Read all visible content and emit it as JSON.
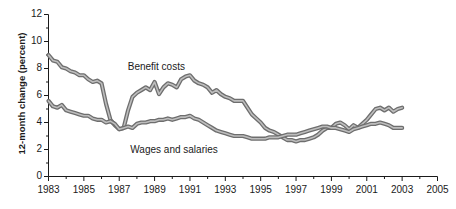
{
  "chart_data": {
    "type": "line",
    "title": "",
    "xlabel": "",
    "ylabel": "12-month change (percent)",
    "xlim": [
      1983,
      2005
    ],
    "ylim": [
      0,
      12
    ],
    "grid": false,
    "legend_position": "inline-annotations",
    "y_ticks": [
      0,
      2,
      4,
      6,
      8,
      10,
      12
    ],
    "y_tick_labels": [
      "0",
      "2",
      "4",
      "6",
      "8",
      "10",
      "12"
    ],
    "y_minor_tick_step": 1,
    "x_ticks": [
      1983,
      1985,
      1987,
      1989,
      1991,
      1993,
      1995,
      1997,
      1999,
      2001,
      2003,
      2005
    ],
    "x_tick_labels": [
      "1983",
      "1985",
      "1987",
      "1989",
      "1991",
      "1993",
      "1995",
      "1997",
      "1999",
      "2001",
      "2003",
      "2005"
    ],
    "x_minor_tick_step": 1,
    "line_color": "#808080",
    "line_edge_color": "#6e6e6e",
    "axis_color": "#1a1a1a",
    "series": [
      {
        "name": "Benefit costs",
        "color": "#808080",
        "label_x": 1989.1,
        "label_y": 8.05,
        "x": [
          1983.0,
          1983.25,
          1983.5,
          1983.75,
          1984.0,
          1984.25,
          1984.5,
          1984.75,
          1985.0,
          1985.25,
          1985.5,
          1985.75,
          1986.0,
          1986.25,
          1986.5,
          1986.75,
          1987.0,
          1987.25,
          1987.5,
          1987.75,
          1988.0,
          1988.25,
          1988.5,
          1988.75,
          1989.0,
          1989.25,
          1989.5,
          1989.75,
          1990.0,
          1990.25,
          1990.5,
          1990.75,
          1991.0,
          1991.25,
          1991.5,
          1991.75,
          1992.0,
          1992.25,
          1992.5,
          1992.75,
          1993.0,
          1993.25,
          1993.5,
          1993.75,
          1994.0,
          1994.25,
          1994.5,
          1994.75,
          1995.0,
          1995.25,
          1995.5,
          1995.75,
          1996.0,
          1996.25,
          1996.5,
          1996.75,
          1997.0,
          1997.25,
          1997.5,
          1997.75,
          1998.0,
          1998.25,
          1998.5,
          1998.75,
          1999.0,
          1999.25,
          1999.5,
          1999.75,
          2000.0,
          2000.25,
          2000.5,
          2000.75,
          2001.0,
          2001.25,
          2001.5,
          2001.75,
          2002.0,
          2002.25,
          2002.5,
          2002.75,
          2003.0
        ],
        "values": [
          9.0,
          8.6,
          8.5,
          8.1,
          8.0,
          7.8,
          7.7,
          7.5,
          7.5,
          7.2,
          7.0,
          7.1,
          6.9,
          5.4,
          4.2,
          3.8,
          3.5,
          3.6,
          4.9,
          5.9,
          6.2,
          6.4,
          6.6,
          6.4,
          7.0,
          6.1,
          6.6,
          6.9,
          6.8,
          6.6,
          7.2,
          7.4,
          7.5,
          7.1,
          6.9,
          6.8,
          6.6,
          6.2,
          6.4,
          6.1,
          5.9,
          5.8,
          5.6,
          5.6,
          5.6,
          5.1,
          4.6,
          4.3,
          4.0,
          3.6,
          3.4,
          3.3,
          3.1,
          2.9,
          2.7,
          2.7,
          2.6,
          2.7,
          2.7,
          2.8,
          2.9,
          3.1,
          3.4,
          3.6,
          3.6,
          3.9,
          4.0,
          3.8,
          3.5,
          3.8,
          3.6,
          3.9,
          4.2,
          4.6,
          5.0,
          5.1,
          4.9,
          5.1,
          4.8,
          5.0,
          5.1
        ]
      },
      {
        "name": "Wages and salaries",
        "color": "#808080",
        "label_x": 1990.1,
        "label_y": 1.95,
        "x": [
          1983.0,
          1983.25,
          1983.5,
          1983.75,
          1984.0,
          1984.25,
          1984.5,
          1984.75,
          1985.0,
          1985.25,
          1985.5,
          1985.75,
          1986.0,
          1986.25,
          1986.5,
          1986.75,
          1987.0,
          1987.25,
          1987.5,
          1987.75,
          1988.0,
          1988.25,
          1988.5,
          1988.75,
          1989.0,
          1989.25,
          1989.5,
          1989.75,
          1990.0,
          1990.25,
          1990.5,
          1990.75,
          1991.0,
          1991.25,
          1991.5,
          1991.75,
          1992.0,
          1992.25,
          1992.5,
          1992.75,
          1993.0,
          1993.25,
          1993.5,
          1993.75,
          1994.0,
          1994.25,
          1994.5,
          1994.75,
          1995.0,
          1995.25,
          1995.5,
          1995.75,
          1996.0,
          1996.25,
          1996.5,
          1996.75,
          1997.0,
          1997.25,
          1997.5,
          1997.75,
          1998.0,
          1998.25,
          1998.5,
          1998.75,
          1999.0,
          1999.25,
          1999.5,
          1999.75,
          2000.0,
          2000.25,
          2000.5,
          2000.75,
          2001.0,
          2001.25,
          2001.5,
          2001.75,
          2002.0,
          2002.25,
          2002.5,
          2002.75,
          2003.0
        ],
        "values": [
          5.6,
          5.2,
          5.1,
          5.3,
          4.9,
          4.8,
          4.7,
          4.6,
          4.5,
          4.5,
          4.3,
          4.2,
          4.2,
          4.0,
          4.1,
          3.9,
          3.5,
          3.6,
          3.7,
          3.6,
          3.9,
          4.0,
          4.0,
          4.1,
          4.1,
          4.2,
          4.2,
          4.3,
          4.2,
          4.3,
          4.4,
          4.4,
          4.5,
          4.3,
          4.2,
          4.0,
          3.8,
          3.6,
          3.4,
          3.3,
          3.2,
          3.1,
          3.0,
          3.0,
          3.0,
          2.9,
          2.8,
          2.8,
          2.8,
          2.8,
          2.9,
          2.9,
          2.9,
          3.0,
          3.1,
          3.1,
          3.1,
          3.2,
          3.3,
          3.4,
          3.5,
          3.6,
          3.7,
          3.7,
          3.6,
          3.6,
          3.5,
          3.4,
          3.3,
          3.5,
          3.6,
          3.7,
          3.8,
          3.9,
          3.9,
          4.0,
          3.9,
          3.8,
          3.6,
          3.6,
          3.6
        ]
      }
    ]
  },
  "axis": {
    "y_title": "12-month change (percent)"
  }
}
